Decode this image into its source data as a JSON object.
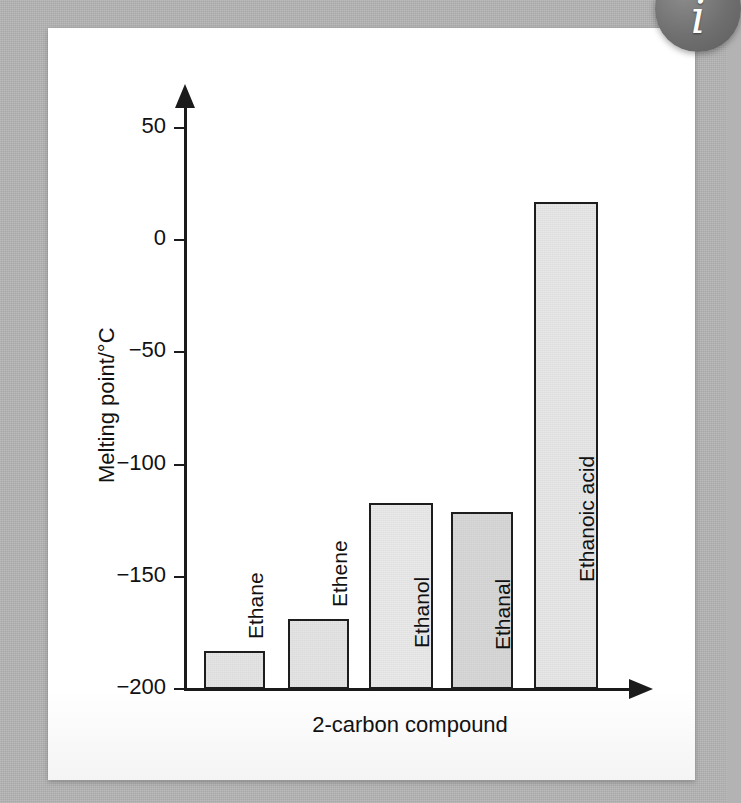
{
  "figure": {
    "background_color": "#b3b3b3",
    "panel_color": "#fdfdfd"
  },
  "watermark": {
    "name": "info-badge",
    "glyph": "i",
    "color": "#6f6f6f"
  },
  "chart_data": {
    "type": "bar",
    "title": "",
    "xlabel": "2-carbon compound",
    "ylabel": "Melting point/°C",
    "categories": [
      "Ethane",
      "Ethene",
      "Ethanol",
      "Ethanal",
      "Ethanoic acid"
    ],
    "values": [
      -183,
      -169,
      -117,
      -121,
      17
    ],
    "ylim": [
      -200,
      60
    ],
    "yticks": [
      50,
      0,
      -50,
      -100,
      -150,
      -200
    ],
    "ytick_labels": [
      "50",
      "0",
      "−50",
      "−100",
      "−150",
      "−200"
    ],
    "grid": false,
    "legend": "none",
    "bar_colors": [
      "#e3e3e3",
      "#e3e3e3",
      "#e8e8e8",
      "#d6d6d6",
      "#e6e6e6"
    ],
    "bar_edge_color": "#1d1d1d",
    "axis_color": "#1b1b1b",
    "bar_label_positions": [
      "above",
      "above",
      "inside",
      "inside",
      "inside"
    ]
  }
}
